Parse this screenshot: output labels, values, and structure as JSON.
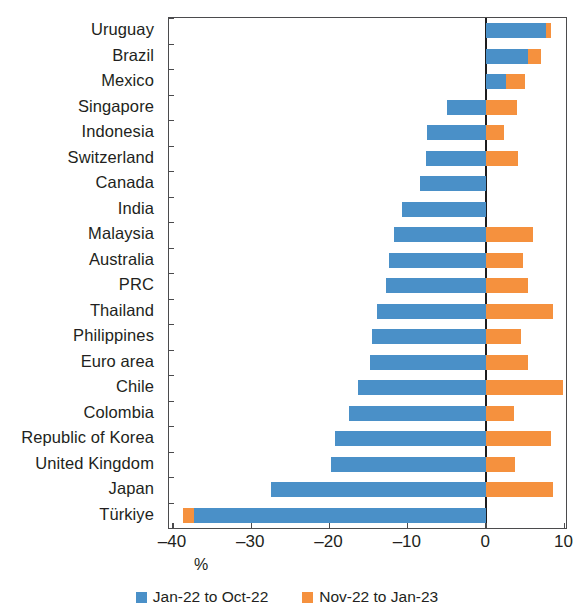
{
  "chart_data": {
    "type": "bar",
    "orientation": "horizontal",
    "stacked": true,
    "title": "",
    "subtitle": "",
    "xlabel": "%",
    "ylabel": "",
    "xlim": [
      -40.5,
      10.2
    ],
    "xticks": [
      -40,
      -30,
      -20,
      -10,
      0,
      10
    ],
    "xticklabels": [
      "–40",
      "–30",
      "–20",
      "–10",
      "0",
      "10"
    ],
    "grid": false,
    "legend_position": "bottom",
    "categories": [
      "Uruguay",
      "Brazil",
      "Mexico",
      "Singapore",
      "Indonesia",
      "Switzerland",
      "Canada",
      "India",
      "Malaysia",
      "Australia",
      "PRC",
      "Thailand",
      "Philippines",
      "Euro area",
      "Chile",
      "Colombia",
      "Republic of Korea",
      "United Kingdom",
      "Japan",
      "Türkiye"
    ],
    "series": [
      {
        "name": "Jan-22 to Oct-22",
        "color": "#4a90c8",
        "values": [
          7.6,
          5.3,
          2.5,
          -5.0,
          -7.5,
          -7.7,
          -8.4,
          -10.8,
          -11.8,
          -12.4,
          -12.8,
          -14.0,
          -14.6,
          -14.8,
          -16.3,
          -17.5,
          -19.3,
          -19.8,
          -27.5,
          -37.3
        ]
      },
      {
        "name": "Nov-22 to Jan-23",
        "color": "#f5913e",
        "values": [
          0.7,
          1.7,
          2.5,
          4.0,
          2.3,
          4.1,
          0.0,
          0.0,
          6.0,
          4.7,
          5.3,
          8.5,
          4.5,
          5.3,
          9.8,
          3.5,
          8.3,
          3.7,
          8.5,
          -1.4
        ]
      }
    ]
  },
  "legend": {
    "items": [
      {
        "label": "Jan-22 to Oct-22",
        "color": "#4a90c8",
        "swatch_name": "legend-swatch-blue"
      },
      {
        "label": "Nov-22 to Jan-23",
        "color": "#f5913e",
        "swatch_name": "legend-swatch-orange"
      }
    ]
  },
  "axis": {
    "x_title": "%"
  }
}
